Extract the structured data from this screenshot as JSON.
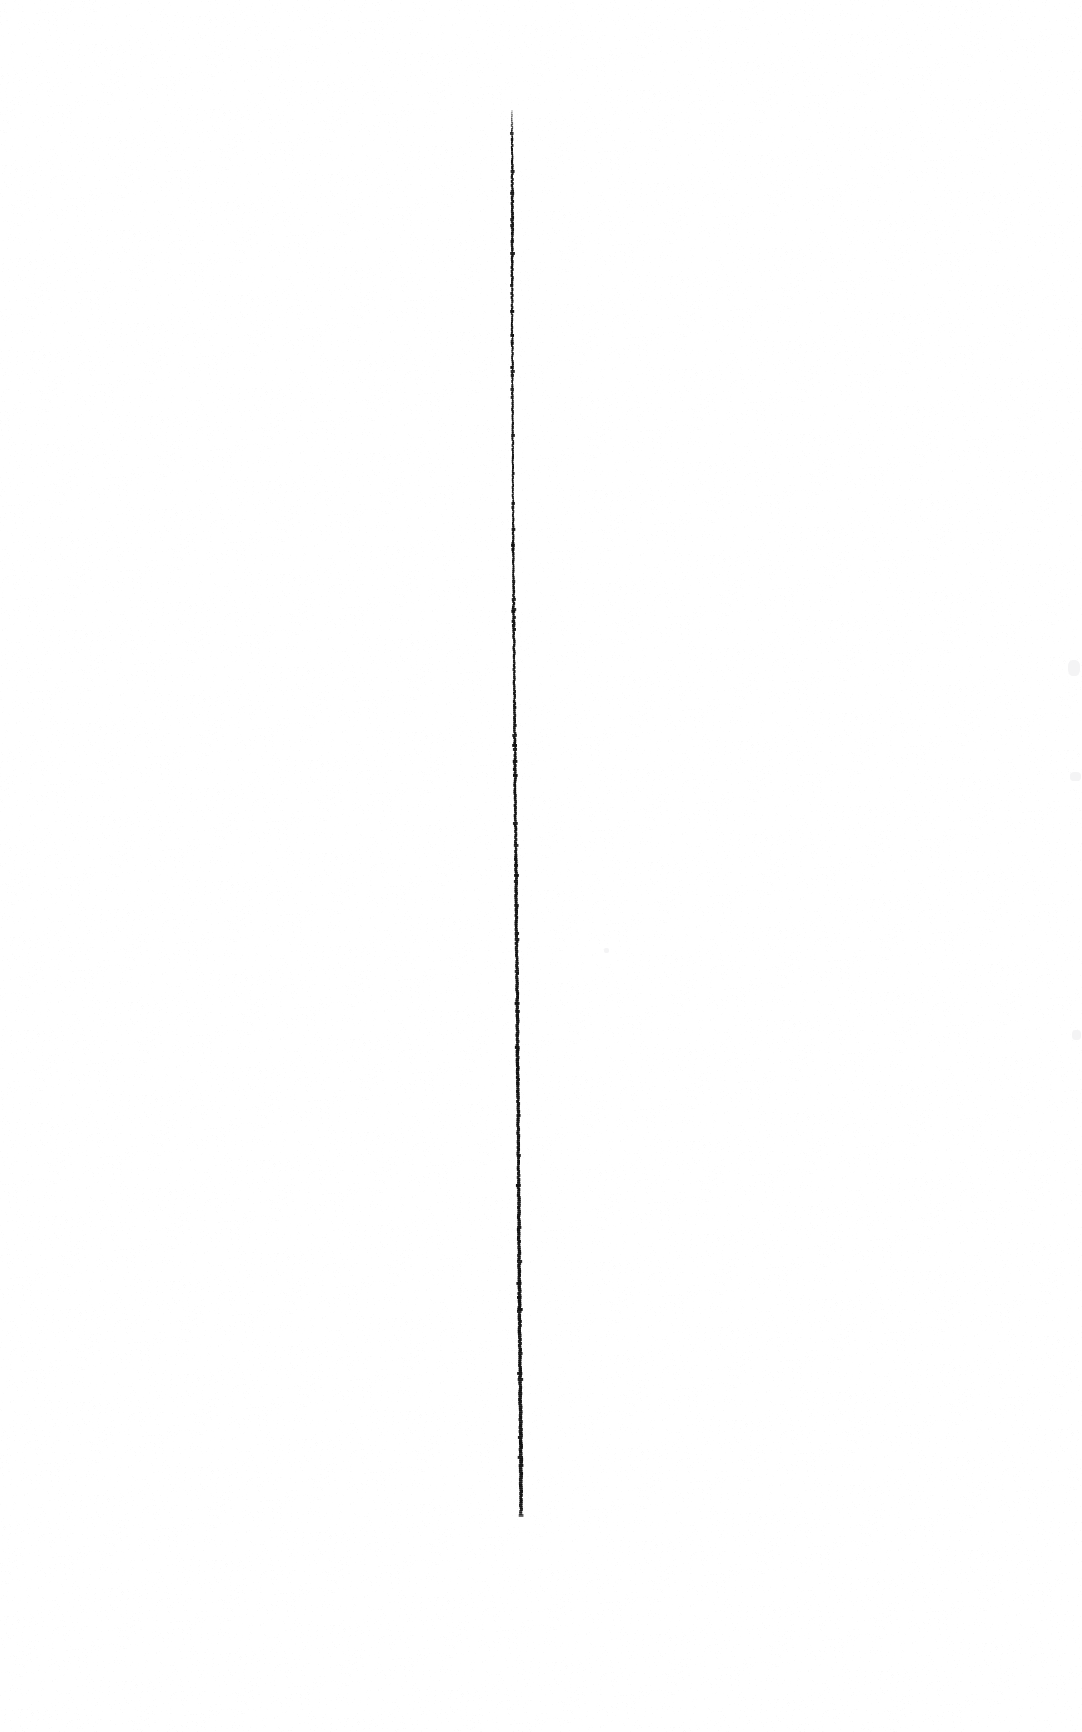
{
  "image": {
    "title": "Vertical ink line on blank page",
    "width": 1082,
    "height": 1732,
    "background_color": "#ffffff",
    "ink_color": "#111111",
    "medium": "scanned paper",
    "content_summary": "A single thin, nearly vertical hand-drawn ink line on an otherwise blank white page."
  },
  "chart_data": {
    "type": "line",
    "title": "",
    "subtitle": "",
    "xlabel": "",
    "ylabel": "",
    "grid": false,
    "legend": null,
    "annotations": [],
    "xlim": [
      0,
      1082
    ],
    "ylim": [
      0,
      1732
    ],
    "series": [
      {
        "name": "ink-stroke",
        "color": "#111111",
        "stroke_width_px": 2.6,
        "points": [
          {
            "x": 512.0,
            "y": 110
          },
          {
            "x": 512.2,
            "y": 160
          },
          {
            "x": 512.3,
            "y": 210
          },
          {
            "x": 512.2,
            "y": 260
          },
          {
            "x": 512.1,
            "y": 310
          },
          {
            "x": 512.4,
            "y": 360
          },
          {
            "x": 512.6,
            "y": 410
          },
          {
            "x": 512.9,
            "y": 460
          },
          {
            "x": 513.1,
            "y": 510
          },
          {
            "x": 513.4,
            "y": 560
          },
          {
            "x": 513.7,
            "y": 610
          },
          {
            "x": 514.1,
            "y": 660
          },
          {
            "x": 514.5,
            "y": 710
          },
          {
            "x": 515.0,
            "y": 760
          },
          {
            "x": 515.4,
            "y": 810
          },
          {
            "x": 515.9,
            "y": 860
          },
          {
            "x": 516.4,
            "y": 910
          },
          {
            "x": 516.9,
            "y": 960
          },
          {
            "x": 517.3,
            "y": 1010
          },
          {
            "x": 517.7,
            "y": 1060
          },
          {
            "x": 518.1,
            "y": 1110
          },
          {
            "x": 518.4,
            "y": 1160
          },
          {
            "x": 518.8,
            "y": 1210
          },
          {
            "x": 519.2,
            "y": 1260
          },
          {
            "x": 519.6,
            "y": 1310
          },
          {
            "x": 520.0,
            "y": 1360
          },
          {
            "x": 520.4,
            "y": 1410
          },
          {
            "x": 520.8,
            "y": 1460
          },
          {
            "x": 521.1,
            "y": 1514
          }
        ],
        "width_profile": [
          {
            "y": 110,
            "w": 1.3
          },
          {
            "y": 160,
            "w": 1.9
          },
          {
            "y": 210,
            "w": 2.6
          },
          {
            "y": 260,
            "w": 2.3
          },
          {
            "y": 310,
            "w": 1.8
          },
          {
            "y": 360,
            "w": 1.7
          },
          {
            "y": 410,
            "w": 1.9
          },
          {
            "y": 460,
            "w": 1.8
          },
          {
            "y": 510,
            "w": 1.7
          },
          {
            "y": 560,
            "w": 2.0
          },
          {
            "y": 610,
            "w": 2.3
          },
          {
            "y": 660,
            "w": 2.1
          },
          {
            "y": 710,
            "w": 2.4
          },
          {
            "y": 760,
            "w": 2.6
          },
          {
            "y": 810,
            "w": 2.5
          },
          {
            "y": 860,
            "w": 2.7
          },
          {
            "y": 910,
            "w": 2.9
          },
          {
            "y": 960,
            "w": 3.0
          },
          {
            "y": 1010,
            "w": 3.1
          },
          {
            "y": 1060,
            "w": 3.3
          },
          {
            "y": 1110,
            "w": 3.0
          },
          {
            "y": 1160,
            "w": 2.9
          },
          {
            "y": 1210,
            "w": 3.1
          },
          {
            "y": 1260,
            "w": 3.2
          },
          {
            "y": 1310,
            "w": 3.3
          },
          {
            "y": 1360,
            "w": 3.1
          },
          {
            "y": 1410,
            "w": 3.4
          },
          {
            "y": 1460,
            "w": 3.6
          },
          {
            "y": 1514,
            "w": 3.0
          }
        ]
      }
    ]
  },
  "artifacts": {
    "description": "Very faint grey scanner smudges near the right margin.",
    "color": "#f4f4f5",
    "marks": [
      {
        "name": "smudge-upper-right",
        "x": 1068,
        "y": 660,
        "width": 12,
        "height": 16
      },
      {
        "name": "smudge-mid-right",
        "x": 1070,
        "y": 772,
        "width": 11,
        "height": 9
      },
      {
        "name": "smudge-lower-right",
        "x": 1072,
        "y": 1030,
        "width": 9,
        "height": 10
      },
      {
        "name": "smudge-bottom-center",
        "x": 604,
        "y": 948,
        "width": 5,
        "height": 5
      }
    ]
  }
}
